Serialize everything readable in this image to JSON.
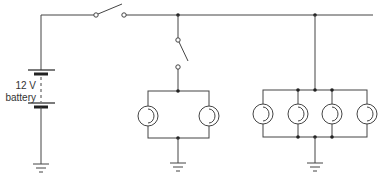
{
  "diagram": {
    "type": "circuit schematic",
    "battery": {
      "label_line1": "12 V",
      "label_line2": "battery"
    },
    "components": {
      "switches": [
        "main-switch",
        "branch-switch"
      ],
      "lamp_groups": [
        {
          "name": "left-lamp-group",
          "lamp_count": 2,
          "connection": "parallel"
        },
        {
          "name": "right-lamp-group",
          "lamp_count": 4,
          "connection": "parallel"
        }
      ],
      "grounds": 3
    },
    "colors": {
      "wire": "#444444",
      "background": "#ffffff"
    }
  }
}
